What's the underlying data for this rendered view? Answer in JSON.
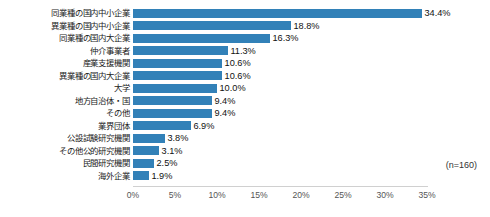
{
  "chart_data": {
    "type": "bar",
    "orientation": "horizontal",
    "title": "",
    "subtitle": "",
    "xlabel": "",
    "ylabel": "",
    "xlim": [
      0,
      35
    ],
    "xticks": [
      "0%",
      "5%",
      "10%",
      "15%",
      "20%",
      "25%",
      "30%",
      "35%"
    ],
    "xtick_values": [
      0,
      5,
      10,
      15,
      20,
      25,
      30,
      35
    ],
    "grid": false,
    "legend": false,
    "bar_color": "#3281b8",
    "annotation": "(n=160)",
    "categories": [
      "同業種の国内中小企業",
      "異業種の国内中小企業",
      "同業種の国内大企業",
      "仲介事業者",
      "産業支援機関",
      "異業種の国内大企業",
      "大学",
      "地方自治体・国",
      "その他",
      "業界団体",
      "公設試験研究機関",
      "その他公的研究機関",
      "民間研究機関",
      "海外企業"
    ],
    "values": [
      34.4,
      18.8,
      16.3,
      11.3,
      10.6,
      10.6,
      10.0,
      9.4,
      9.4,
      6.9,
      3.8,
      3.1,
      2.5,
      1.9
    ],
    "value_labels": [
      "34.4%",
      "18.8%",
      "16.3%",
      "11.3%",
      "10.6%",
      "10.6%",
      "10.0%",
      "9.4%",
      "9.4%",
      "6.9%",
      "3.8%",
      "3.1%",
      "2.5%",
      "1.9%"
    ]
  }
}
